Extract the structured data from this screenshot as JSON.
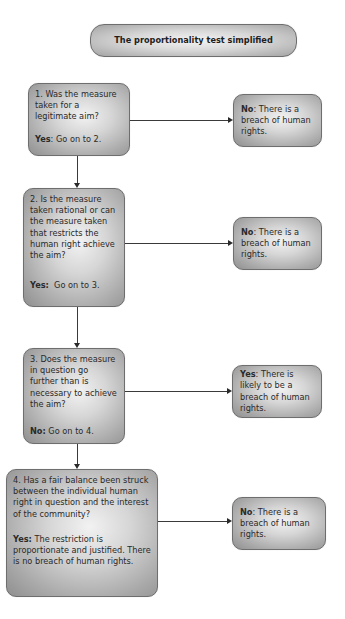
{
  "title": "The proportionality test simplified",
  "steps": [
    {
      "question": "1. Was the measure taken for a legitimate aim?",
      "continue_label": "Yes",
      "continue_text": ": Go on to 2.",
      "outcome_label": "No",
      "outcome_text": ": There is a breach of human rights."
    },
    {
      "question": "2. Is the measure taken rational or can the measure taken that restricts the human right achieve the aim?",
      "continue_label": "Yes:",
      "continue_text": "  Go on to 3.",
      "outcome_label": "No",
      "outcome_text": ": There is a breach of human rights."
    },
    {
      "question": "3. Does the measure in question go further than is necessary to achieve the aim?",
      "continue_label": "No:",
      "continue_text": " Go on to 4.",
      "outcome_label": "Yes",
      "outcome_text": ": There is likely to be a breach of human rights."
    },
    {
      "question": "4. Has a fair balance been struck between the individual human right in question and the interest of the community?",
      "continue_label": "Yes:",
      "continue_text": " The restriction is proportionate and justified. There is no breach of human rights.",
      "outcome_label": "No",
      "outcome_text": ": There is a breach of human rights."
    }
  ],
  "colors": {
    "box_fill_center": "#f2f2f2",
    "box_fill_edge": "#8f8f8f",
    "box_border": "#6e6e6e",
    "text": "#2a2a2a",
    "connector": "#3a3a3a"
  }
}
